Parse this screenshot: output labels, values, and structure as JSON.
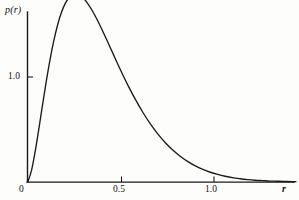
{
  "figure": {
    "background_color": "#fdfdfc",
    "curve_color": "#1a1a1a",
    "axis_color": "#1a1a1a"
  },
  "axes": {
    "y_axis_label": "p(r)",
    "x_axis_label": "r",
    "origin_label": "0"
  },
  "chart_data": {
    "type": "line",
    "title": "",
    "subtitle": "",
    "xlabel": "r",
    "ylabel": "p(r)",
    "xlim": [
      0,
      1.44
    ],
    "ylim": [
      0,
      1.84
    ],
    "grid": false,
    "legend": null,
    "x_ticks": [
      {
        "value": 0,
        "label": "0"
      },
      {
        "value": 0.5,
        "label": "0.5"
      },
      {
        "value": 1.0,
        "label": "1.0"
      }
    ],
    "y_ticks": [
      {
        "value": 0,
        "label": "0"
      },
      {
        "value": 1.0,
        "label": "1.0"
      }
    ],
    "series": [
      {
        "name": "p(r)",
        "x": [
          0.0,
          0.02,
          0.04,
          0.06,
          0.08,
          0.1,
          0.12,
          0.14,
          0.16,
          0.18,
          0.2,
          0.22,
          0.24,
          0.26,
          0.28,
          0.3,
          0.32,
          0.34,
          0.36,
          0.38,
          0.4,
          0.42,
          0.44,
          0.46,
          0.48,
          0.5,
          0.54,
          0.58,
          0.62,
          0.66,
          0.7,
          0.74,
          0.78,
          0.82,
          0.86,
          0.9,
          0.94,
          0.98,
          1.02,
          1.06,
          1.1,
          1.14,
          1.18,
          1.22,
          1.26,
          1.3,
          1.34,
          1.38,
          1.42,
          1.44
        ],
        "y": [
          0.0,
          0.111,
          0.294,
          0.514,
          0.744,
          0.967,
          1.171,
          1.348,
          1.495,
          1.611,
          1.696,
          1.752,
          1.782,
          1.789,
          1.776,
          1.747,
          1.704,
          1.65,
          1.588,
          1.519,
          1.445,
          1.369,
          1.291,
          1.213,
          1.135,
          1.059,
          0.913,
          0.779,
          0.657,
          0.549,
          0.454,
          0.372,
          0.302,
          0.243,
          0.194,
          0.153,
          0.12,
          0.093,
          0.072,
          0.055,
          0.041,
          0.031,
          0.023,
          0.017,
          0.013,
          0.009,
          0.007,
          0.005,
          0.003,
          0.003
        ]
      }
    ],
    "annotations": []
  }
}
